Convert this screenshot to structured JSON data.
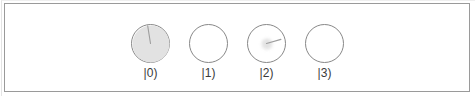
{
  "panel": {
    "background_color": "#ffffff",
    "border_color": "#9a9a9a"
  },
  "display": {
    "type": "amplitude-phase-disc-row",
    "disc_outline_color": "#888888",
    "amplitude_fill_color": "#e2e2e2",
    "needle_color": "#9d9d9d",
    "states": [
      {
        "label": "|0)",
        "amplitude_fraction": 1.0,
        "fill_diameter_px": 37,
        "has_needle": true,
        "needle_angle_deg": 99,
        "needle_length_px": 18
      },
      {
        "label": "|1)",
        "amplitude_fraction": 0.0,
        "fill_diameter_px": 0,
        "has_needle": false,
        "needle_angle_deg": 0,
        "needle_length_px": 0
      },
      {
        "label": "|2)",
        "amplitude_fraction": 0.28,
        "fill_diameter_px": 11,
        "has_needle": true,
        "needle_angle_deg": 16,
        "needle_length_px": 15
      },
      {
        "label": "|3)",
        "amplitude_fraction": 0.0,
        "fill_diameter_px": 0,
        "has_needle": false,
        "needle_angle_deg": 0,
        "needle_length_px": 0
      }
    ]
  }
}
